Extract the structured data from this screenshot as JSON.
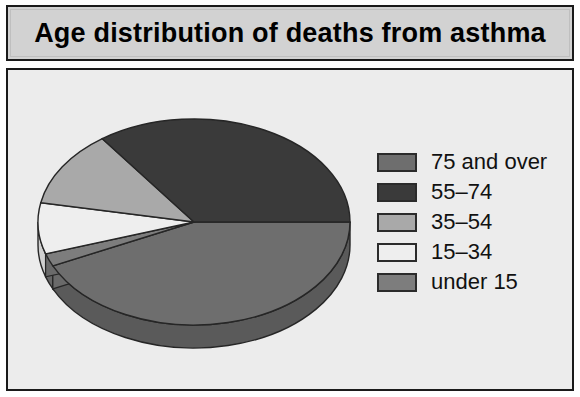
{
  "title": "Age distribution of deaths from asthma",
  "colors": {
    "panel_background": "#ececec",
    "title_background": "#d2d2d2",
    "border": "#1a1a1a",
    "text": "#111111",
    "slice_75_and_over": "#6e6e6e",
    "slice_55_74": "#3a3a3a",
    "slice_35_54": "#a9a9a9",
    "slice_15_34": "#eeeeee",
    "slice_under_15": "#7d7d7d",
    "side_75_and_over": "#5a5a5a",
    "side_55_74": "#2a2a2a",
    "side_35_54": "#8f8f8f",
    "side_15_34": "#d0d0d0",
    "side_under_15": "#666666",
    "slice_outline": "#262626"
  },
  "legend": {
    "items": [
      {
        "label": "75 and over",
        "color": "#6e6e6e"
      },
      {
        "label": "55–74",
        "color": "#3a3a3a"
      },
      {
        "label": "35–54",
        "color": "#a9a9a9"
      },
      {
        "label": "15–34",
        "color": "#eeeeee"
      },
      {
        "label": "under 15",
        "color": "#7d7d7d"
      }
    ]
  },
  "chart_data": {
    "type": "pie",
    "title": "Age distribution of deaths from asthma",
    "xlabel": "",
    "ylabel": "",
    "three_d": true,
    "legend_position": "right",
    "grid": false,
    "categories": [
      "75 and over",
      "55–74",
      "35–54",
      "15–34",
      "under 15"
    ],
    "values": [
      43,
      35,
      12,
      8,
      2
    ],
    "units": "percent",
    "slices": [
      {
        "label": "75 and over",
        "value": 43,
        "color": "#6e6e6e",
        "start_angle": 0,
        "end_angle": 154.8
      },
      {
        "label": "under 15",
        "value": 2,
        "color": "#7d7d7d",
        "start_angle": 154.8,
        "end_angle": 162.0
      },
      {
        "label": "15–34",
        "value": 8,
        "color": "#eeeeee",
        "start_angle": 162.0,
        "end_angle": 190.8
      },
      {
        "label": "35–54",
        "value": 12,
        "color": "#a9a9a9",
        "start_angle": 190.8,
        "end_angle": 234.0
      },
      {
        "label": "55–74",
        "value": 35,
        "color": "#3a3a3a",
        "start_angle": 234.0,
        "end_angle": 360.0
      }
    ]
  }
}
